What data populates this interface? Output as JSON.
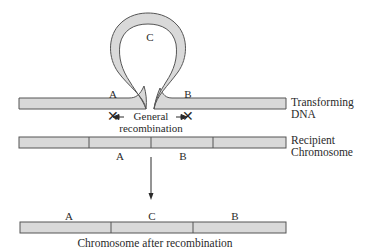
{
  "diagram": {
    "colors": {
      "dna_fill": "#d9d9d9",
      "dna_stroke": "#555555",
      "text": "#2a2a2a",
      "background": "#ffffff"
    },
    "transforming_dna": {
      "label_line1": "Transforming",
      "label_line2": "DNA",
      "left_gene": "A",
      "loop_gene": "C",
      "right_gene": "B"
    },
    "crossover": {
      "marker_left": "✕",
      "marker_right": "✕",
      "label_line1": "General",
      "label_line2": "recombination"
    },
    "recipient": {
      "label_line1": "Recipient",
      "label_line2": "Chromosome",
      "genes": [
        "A",
        "B"
      ]
    },
    "result": {
      "genes": [
        "A",
        "C",
        "B"
      ],
      "caption": "Chromosome after recombination"
    }
  }
}
